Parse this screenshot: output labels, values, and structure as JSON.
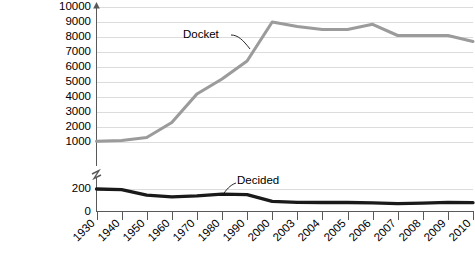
{
  "chart_data": {
    "type": "line",
    "title": "",
    "subtitle": "",
    "xlabel": "",
    "ylabel": "",
    "grid": true,
    "legend_position": "inline-annotation",
    "axis_break": {
      "present": true,
      "between": [
        200,
        1000
      ],
      "note": "y-axis is broken between 200 and 1000"
    },
    "x": [
      "1930",
      "1940",
      "1950",
      "1960",
      "1970",
      "1980",
      "1990",
      "2000",
      "2003",
      "2004",
      "2005",
      "2006",
      "2007",
      "2008",
      "2009",
      "2010"
    ],
    "xtick_labels": [
      "1930",
      "1940",
      "1950",
      "1960",
      "1970",
      "1980",
      "1990",
      "2000",
      "2003",
      "2004",
      "2005",
      "2006",
      "2007",
      "2008",
      "2009",
      "2010"
    ],
    "ytick_labels_upper": [
      "10000",
      "9000",
      "8000",
      "7000",
      "6000",
      "5000",
      "4000",
      "3000",
      "2000",
      "1000"
    ],
    "ytick_values_upper": [
      10000,
      9000,
      8000,
      7000,
      6000,
      5000,
      4000,
      3000,
      2000,
      1000
    ],
    "ytick_labels_lower": [
      "200",
      "0"
    ],
    "ytick_values_lower": [
      200,
      0
    ],
    "ylim_upper": [
      1000,
      10000
    ],
    "ylim_lower": [
      0,
      200
    ],
    "series": [
      {
        "name": "Docket",
        "color": "#9b9b9b",
        "scale": "upper",
        "label_text": "Docket",
        "values": [
          1050,
          1100,
          1300,
          2300,
          4200,
          5200,
          6400,
          9000,
          8700,
          8500,
          8500,
          8850,
          8100,
          8100,
          8100,
          7700
        ]
      },
      {
        "name": "Decided",
        "color": "#1a1a1a",
        "scale": "lower",
        "label_text": "Decided",
        "values": [
          200,
          195,
          145,
          130,
          140,
          155,
          150,
          90,
          82,
          80,
          80,
          77,
          70,
          75,
          82,
          78
        ]
      }
    ],
    "annotations": [
      {
        "text": "Docket",
        "target_series": "Docket",
        "target_x": "1995"
      },
      {
        "text": "Decided",
        "target_series": "Decided",
        "target_x": "1997"
      }
    ]
  },
  "colors": {
    "docket": "#9b9b9b",
    "decided": "#1a1a1a",
    "gridline": "#dcdcdc",
    "axis": "#595959",
    "background": "#ffffff",
    "text": "#000000"
  }
}
